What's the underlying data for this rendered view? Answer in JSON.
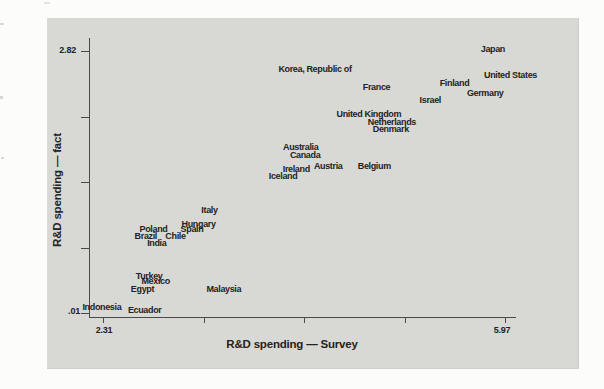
{
  "colors": {
    "page_bg": "#fcfcfa",
    "panel_bg": "#d8d8d5",
    "text": "#232321",
    "axis": "#4a4a48"
  },
  "chart_data": {
    "type": "scatter",
    "marker_style": "country-name-text-labels",
    "title": "",
    "xlabel": "R&D spending — Survey",
    "ylabel": "R&D spending — fact",
    "grid": false,
    "legend": false,
    "x_axis": {
      "min": 2.31,
      "max": 5.97,
      "min_label": "2.31",
      "max_label": "5.97",
      "tick_values": [
        2.31,
        3.225,
        4.14,
        5.055,
        5.97
      ]
    },
    "y_axis": {
      "min": 0.01,
      "max": 2.82,
      "min_label": ".01",
      "max_label": "2.82",
      "tick_values": [
        2.82,
        2.1175,
        1.415,
        0.7125,
        0.01
      ]
    },
    "calibration": {
      "x_min": 2.31,
      "x_max": 5.97,
      "x_min_px": 103,
      "x_max_px": 505,
      "y_min": 0.01,
      "y_max": 2.82,
      "y_min_px": 313,
      "y_max_px": 51
    },
    "points": [
      {
        "name": "Japan",
        "x": 5.86,
        "y": 2.84
      },
      {
        "name": "United States",
        "x": 6.02,
        "y": 2.56
      },
      {
        "name": "Finland",
        "x": 5.51,
        "y": 2.48
      },
      {
        "name": "Germany",
        "x": 5.79,
        "y": 2.37
      },
      {
        "name": "Israel",
        "x": 5.29,
        "y": 2.29
      },
      {
        "name": "Korea, Republic of",
        "x": 4.24,
        "y": 2.63
      },
      {
        "name": "France",
        "x": 4.8,
        "y": 2.43
      },
      {
        "name": "United Kingdom",
        "x": 4.73,
        "y": 2.14
      },
      {
        "name": "Netherlands",
        "x": 4.94,
        "y": 2.06
      },
      {
        "name": "Denmark",
        "x": 4.93,
        "y": 1.98
      },
      {
        "name": "Australia",
        "x": 4.11,
        "y": 1.79
      },
      {
        "name": "Canada",
        "x": 4.15,
        "y": 1.71
      },
      {
        "name": "Austria",
        "x": 4.36,
        "y": 1.59
      },
      {
        "name": "Belgium",
        "x": 4.78,
        "y": 1.59
      },
      {
        "name": "Ireland",
        "x": 4.07,
        "y": 1.55
      },
      {
        "name": "Iceland",
        "x": 3.95,
        "y": 1.48
      },
      {
        "name": "Italy",
        "x": 3.28,
        "y": 1.11
      },
      {
        "name": "Hungary",
        "x": 3.18,
        "y": 0.96
      },
      {
        "name": "Spain",
        "x": 3.12,
        "y": 0.91
      },
      {
        "name": "Poland",
        "x": 2.77,
        "y": 0.91
      },
      {
        "name": "Chile",
        "x": 2.97,
        "y": 0.84
      },
      {
        "name": "Brazil",
        "x": 2.7,
        "y": 0.84
      },
      {
        "name": "India",
        "x": 2.8,
        "y": 0.76
      },
      {
        "name": "Turkey",
        "x": 2.73,
        "y": 0.41
      },
      {
        "name": "Mexico",
        "x": 2.79,
        "y": 0.35
      },
      {
        "name": "Egypt",
        "x": 2.67,
        "y": 0.27
      },
      {
        "name": "Malaysia",
        "x": 3.41,
        "y": 0.27
      },
      {
        "name": "Indonesia",
        "x": 2.3,
        "y": 0.08
      },
      {
        "name": "Ecuador",
        "x": 2.69,
        "y": 0.04
      }
    ]
  }
}
